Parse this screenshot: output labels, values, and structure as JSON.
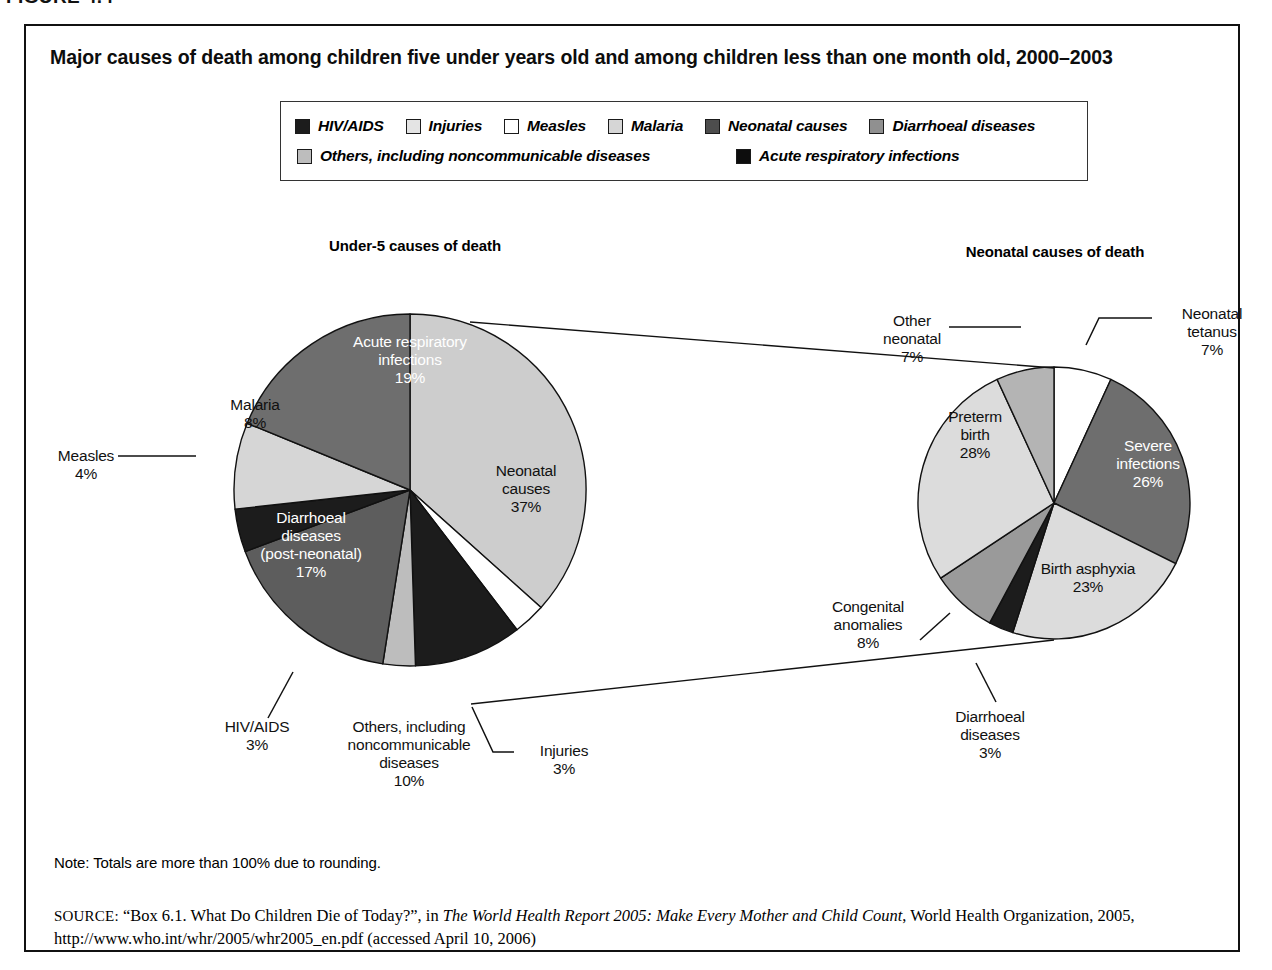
{
  "figure_label": "FIGURE 4.4",
  "chart_title": "Major causes of death among children five under years old and among children less than one month old, 2000–2003",
  "legend": {
    "row1": [
      {
        "label": "HIV/AIDS",
        "color": "#1c1c1c"
      },
      {
        "label": "Injuries",
        "color": "#e4e4e4"
      },
      {
        "label": "Measles",
        "color": "#ffffff"
      },
      {
        "label": "Malaria",
        "color": "#d6d6d6"
      },
      {
        "label": "Neonatal causes",
        "color": "#4d4d4d"
      },
      {
        "label": "Diarrhoeal diseases",
        "color": "#909090"
      }
    ],
    "row2": [
      {
        "label": "Others, including noncommunicable diseases",
        "color": "#bdbdbd"
      },
      {
        "label": "Acute respiratory infections",
        "color": "#0d0d0d"
      }
    ]
  },
  "headings": {
    "left": "Under-5 causes of death",
    "right": "Neonatal causes of death"
  },
  "note": "Note: Totals are more than 100% due to rounding.",
  "source": {
    "prefix": "SOURCE:",
    "part1": " “Box 6.1. What Do Children Die of Today?”, in ",
    "italic": "The World Health Report 2005: Make Every Mother and Child Count",
    "part2": ", World Health Organization, 2005, http://www.who.int/whr/2005/whr2005_en.pdf (accessed April 10, 2006)"
  },
  "labels": {
    "ari": {
      "name": "Acute respiratory\ninfections",
      "value": "19%"
    },
    "malaria": {
      "name": "Malaria",
      "value": "8%"
    },
    "measles": {
      "name": "Measles",
      "value": "4%"
    },
    "diarrhoeal": {
      "name": "Diarrhoeal\ndiseases\n(post-neonatal)",
      "value": "17%"
    },
    "hiv": {
      "name": "HIV/AIDS",
      "value": "3%"
    },
    "others": {
      "name": "Others, including\nnoncommunicable\ndiseases",
      "value": "10%"
    },
    "injuries": {
      "name": "Injuries",
      "value": "3%"
    },
    "neonatal": {
      "name": "Neonatal\ncauses",
      "value": "37%"
    },
    "tetanus": {
      "name": "Neonatal\ntetanus",
      "value": "7%"
    },
    "severe": {
      "name": "Severe\ninfections",
      "value": "26%"
    },
    "asphyxia": {
      "name": "Birth asphyxia",
      "value": "23%"
    },
    "diarr2": {
      "name": "Diarrhoeal\ndiseases",
      "value": "3%"
    },
    "congenital": {
      "name": "Congenital\nanomalies",
      "value": "8%"
    },
    "preterm": {
      "name": "Preterm\nbirth",
      "value": "28%"
    },
    "otherneo": {
      "name": "Other\nneonatal",
      "value": "7%"
    }
  },
  "chart_data": [
    {
      "type": "pie",
      "title": "Under-5 causes of death",
      "start_angle": 0,
      "direction": "clockwise",
      "center": [
        410,
        490
      ],
      "radius": 176,
      "categories": [
        "Neonatal causes",
        "Injuries",
        "Others, including noncommunicable diseases",
        "HIV/AIDS",
        "Diarrhoeal diseases (post-neonatal)",
        "Measles",
        "Malaria",
        "Acute respiratory infections"
      ],
      "values": [
        37,
        3,
        10,
        3,
        17,
        4,
        8,
        19
      ],
      "colors": [
        "#cdcdcd",
        "#ffffff",
        "#1c1c1c",
        "#bdbdbd",
        "#5d5d5d",
        "#1c1c1c",
        "#d6d6d6",
        "#6e6e6e"
      ],
      "label_colors": [
        "dark",
        "dark",
        "light",
        "dark",
        "light",
        "dark",
        "dark",
        "light"
      ]
    },
    {
      "type": "pie",
      "title": "Neonatal causes of death",
      "start_angle": 0,
      "direction": "clockwise",
      "center": [
        1054,
        503
      ],
      "radius": 136,
      "categories": [
        "Neonatal tetanus",
        "Severe infections",
        "Birth asphyxia",
        "Diarrhoeal diseases",
        "Congenital anomalies",
        "Preterm birth",
        "Other neonatal"
      ],
      "values": [
        7,
        26,
        23,
        3,
        8,
        28,
        7
      ],
      "colors": [
        "#ffffff",
        "#6e6e6e",
        "#dcdcdc",
        "#1c1c1c",
        "#9a9a9a",
        "#dcdcdc",
        "#b4b4b4"
      ],
      "label_colors": [
        "dark",
        "light",
        "dark",
        "dark",
        "dark",
        "dark",
        "dark"
      ]
    }
  ]
}
